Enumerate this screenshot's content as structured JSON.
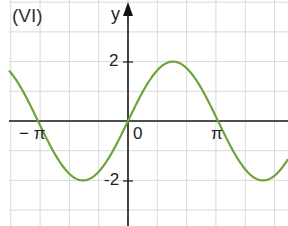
{
  "panel": {
    "label": "(VI)"
  },
  "axes": {
    "y_label": "y",
    "y_tick_pos": "2",
    "y_tick_neg": "-2",
    "origin": "0",
    "x_tick_neg": "− π",
    "x_tick_pos": "π"
  },
  "colors": {
    "curve": "#6ea33a",
    "grid": "#d9d9d9",
    "axis": "#1a1a1a"
  },
  "chart_data": {
    "type": "line",
    "title": "(VI)",
    "xlabel": "",
    "ylabel": "y",
    "function": "y = 2 sin(x)",
    "x_ticks": [
      "-π",
      "0",
      "π"
    ],
    "y_ticks": [
      -2,
      0,
      2
    ],
    "xlim": [
      -4.06,
      5.54
    ],
    "ylim": [
      -3.5,
      4.0
    ],
    "grid": true,
    "grid_x_step": "π/3",
    "grid_y_step": 1,
    "series": [
      {
        "name": "2 sin x",
        "x": [
          -3.98,
          -3.14,
          -2.36,
          -1.57,
          -0.79,
          0,
          0.79,
          1.57,
          2.36,
          3.14,
          3.93,
          4.71,
          5.54
        ],
        "values": [
          1.49,
          0,
          -1.41,
          -2,
          -1.41,
          0,
          1.41,
          2,
          1.41,
          0,
          -1.41,
          -2,
          -1.34
        ]
      }
    ]
  }
}
